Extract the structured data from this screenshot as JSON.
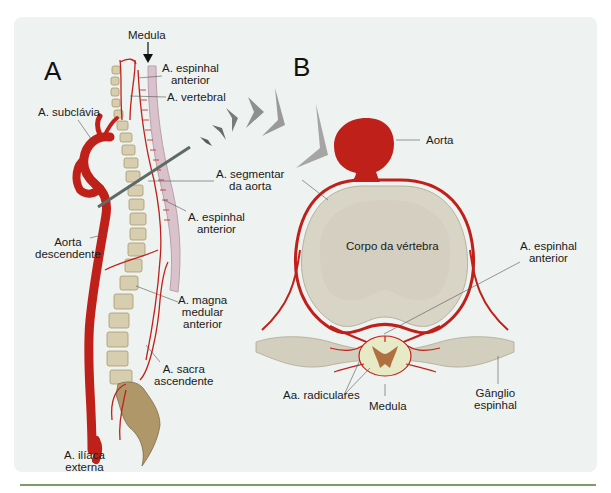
{
  "panels": {
    "a": {
      "letter": "A"
    },
    "b": {
      "letter": "B"
    }
  },
  "labels": {
    "medula_top": "Medula",
    "espinhal_anterior_top_1": "A. espinhal",
    "espinhal_anterior_top_2": "anterior",
    "vertebral": "A. vertebral",
    "subclavia": "A. subclávia",
    "segmentar_1": "A. segmentar",
    "segmentar_2": "da aorta",
    "espinhal_anterior_mid_1": "A. espinhal",
    "espinhal_anterior_mid_2": "anterior",
    "aorta_desc_1": "Aorta",
    "aorta_desc_2": "descendente",
    "magna_1": "A. magna",
    "magna_2": "medular",
    "magna_3": "anterior",
    "sacra_1": "A. sacra",
    "sacra_2": "ascendente",
    "iliaca_1": "A. ilíaca",
    "iliaca_2": "externa",
    "aorta": "Aorta",
    "corpo": "Corpo da vértebra",
    "espinhal_anterior_b_1": "A. espinhal",
    "espinhal_anterior_b_2": "anterior",
    "radiculares": "Aa. radiculares",
    "medula_b": "Medula",
    "ganglio_1": "Gânglio",
    "ganglio_2": "espinhal"
  },
  "colors": {
    "background": "#eef2f0",
    "artery": "#c0201a",
    "bone": "#d8d4c6",
    "rule": "#7f9a6a"
  }
}
